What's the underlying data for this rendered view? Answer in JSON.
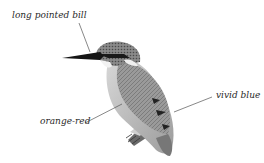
{
  "diagram": {
    "colors": {
      "background": "#ffffff",
      "leader_line": "#555555",
      "label_text": "#2a2a2a"
    },
    "labels": [
      {
        "id": "bill",
        "text": "long pointed bill"
      },
      {
        "id": "blue",
        "text": "vivid blue"
      },
      {
        "id": "orange",
        "text": "orange-red"
      }
    ]
  }
}
